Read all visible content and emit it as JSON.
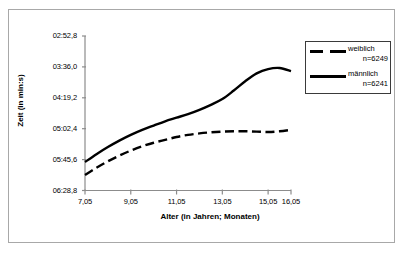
{
  "chart_data": {
    "type": "line",
    "title": "",
    "xlabel": "Alter (in Jahren; Monaten)",
    "ylabel": "Zeit (in min:s)",
    "x_tick_labels": [
      "7,05",
      "9,05",
      "11,05",
      "13,05",
      "15,05",
      "16,05"
    ],
    "x_tick_values": [
      7.05,
      9.05,
      11.05,
      13.05,
      15.05,
      16.05
    ],
    "y_tick_labels": [
      "02:52,8",
      "03:36,0",
      "04:19,2",
      "05:02,4",
      "05:45,6",
      "06:28,8"
    ],
    "y_tick_seconds": [
      172.8,
      216.0,
      259.2,
      302.4,
      345.6,
      388.8
    ],
    "y_axis_inverted": true,
    "ylim_seconds": [
      172.8,
      388.8
    ],
    "xlim": [
      7.05,
      16.05
    ],
    "grid": false,
    "legend_position": "top-right",
    "series": [
      {
        "name": "weiblich",
        "count_label": "n=6249",
        "n": 6249,
        "style": "dashed",
        "color": "#000000",
        "x": [
          7.05,
          7.55,
          8.05,
          8.55,
          9.05,
          9.55,
          10.05,
          10.55,
          11.05,
          11.55,
          12.05,
          12.55,
          13.05,
          13.55,
          14.05,
          14.55,
          15.05,
          15.55,
          16.05
        ],
        "y_seconds": [
          367.0,
          357.0,
          348.0,
          340.0,
          333.0,
          327.0,
          322.0,
          318.0,
          314.0,
          311.0,
          309.0,
          307.5,
          306.5,
          306.0,
          306.0,
          306.5,
          307.0,
          306.0,
          304.0
        ],
        "y_labels": [
          "06:07,0",
          "05:57,0",
          "05:48,0",
          "05:40,0",
          "05:33,0",
          "05:27,0",
          "05:22,0",
          "05:18,0",
          "05:14,0",
          "05:11,0",
          "05:09,0",
          "05:07,5",
          "05:06,5",
          "05:06,0",
          "05:06,0",
          "05:06,5",
          "05:07,0",
          "05:06,0",
          "05:04,0"
        ]
      },
      {
        "name": "männlich",
        "count_label": "n=6241",
        "n": 6241,
        "style": "solid",
        "color": "#000000",
        "x": [
          7.05,
          7.55,
          8.05,
          8.55,
          9.05,
          9.55,
          10.05,
          10.55,
          11.05,
          11.55,
          12.05,
          12.55,
          13.05,
          13.55,
          14.05,
          14.55,
          15.05,
          15.55,
          16.05
        ],
        "y_seconds": [
          349.0,
          338.0,
          328.0,
          319.0,
          311.0,
          304.0,
          298.0,
          292.0,
          287.0,
          282.0,
          276.0,
          269.0,
          261.0,
          249.0,
          236.0,
          225.0,
          219.0,
          217.5,
          222.0
        ],
        "y_labels": [
          "05:49,0",
          "05:38,0",
          "05:28,0",
          "05:19,0",
          "05:11,0",
          "05:04,0",
          "04:58,0",
          "04:52,0",
          "04:47,0",
          "04:42,0",
          "04:36,0",
          "04:29,0",
          "04:21,0",
          "04:09,0",
          "03:56,0",
          "03:45,0",
          "03:39,0",
          "03:37,5",
          "03:42,0"
        ]
      }
    ]
  },
  "legend": {
    "items": [
      {
        "label": "weiblich",
        "count": "n=6249",
        "style": "dashed"
      },
      {
        "label": "männlich",
        "count": "n=6241",
        "style": "solid"
      }
    ]
  }
}
